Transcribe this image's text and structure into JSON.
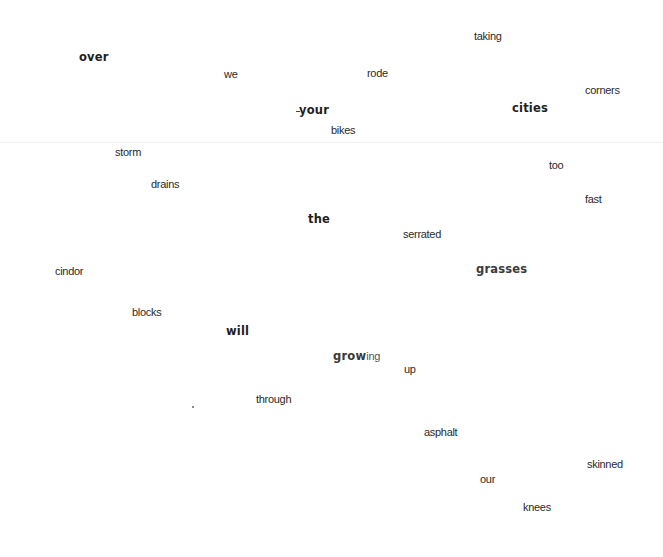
{
  "poem": {
    "words": [
      {
        "text": "taking",
        "x": 474,
        "y": 31,
        "style": "plain"
      },
      {
        "text": "over",
        "x": 79,
        "y": 52,
        "style": "bold"
      },
      {
        "text": "we",
        "x": 224,
        "y": 69,
        "style": "plain"
      },
      {
        "text": "rode",
        "x": 367,
        "y": 68,
        "style": "plain"
      },
      {
        "text": "corners",
        "x": 585,
        "y": 85,
        "style": "plain"
      },
      {
        "text": "your",
        "x": 299,
        "y": 105,
        "style": "bold"
      },
      {
        "text": "cities",
        "x": 512,
        "y": 103,
        "style": "bold"
      },
      {
        "text": "bikes",
        "x": 331,
        "y": 125,
        "style": "plain"
      },
      {
        "text": "storm",
        "x": 115,
        "y": 147,
        "style": "plain"
      },
      {
        "text": "too",
        "x": 549,
        "y": 160,
        "style": "plain"
      },
      {
        "text": "drains",
        "x": 151,
        "y": 179,
        "style": "plain"
      },
      {
        "text": "fast",
        "x": 585,
        "y": 194,
        "style": "plain"
      },
      {
        "text": "the",
        "x": 308,
        "y": 214,
        "style": "bold"
      },
      {
        "text": "serrated",
        "x": 403,
        "y": 229,
        "style": "plain"
      },
      {
        "text": "grasses",
        "x": 476,
        "y": 264,
        "style": "bold dim"
      },
      {
        "text": "cindor",
        "x": 55,
        "y": 266,
        "style": "plain"
      },
      {
        "text": "blocks",
        "x": 132,
        "y": 307,
        "style": "plain"
      },
      {
        "text": "will",
        "x": 226,
        "y": 326,
        "style": "bold"
      },
      {
        "text": "up",
        "x": 404,
        "y": 364,
        "style": "plain"
      },
      {
        "text": "through",
        "x": 256,
        "y": 394,
        "style": "plain"
      },
      {
        "text": "asphalt",
        "x": 424,
        "y": 427,
        "style": "plain"
      },
      {
        "text": "skinned",
        "x": 587,
        "y": 459,
        "style": "plain"
      },
      {
        "text": "our",
        "x": 480,
        "y": 474,
        "style": "plain"
      },
      {
        "text": "knees",
        "x": 523,
        "y": 502,
        "style": "plain"
      }
    ],
    "growing": {
      "bold_part": "grow",
      "tail_part": "ing",
      "x": 333,
      "y": 347
    }
  },
  "colors": {
    "background": "#ffffff",
    "text": "#2a2a2a",
    "bold_text": "#1e1e1e"
  }
}
